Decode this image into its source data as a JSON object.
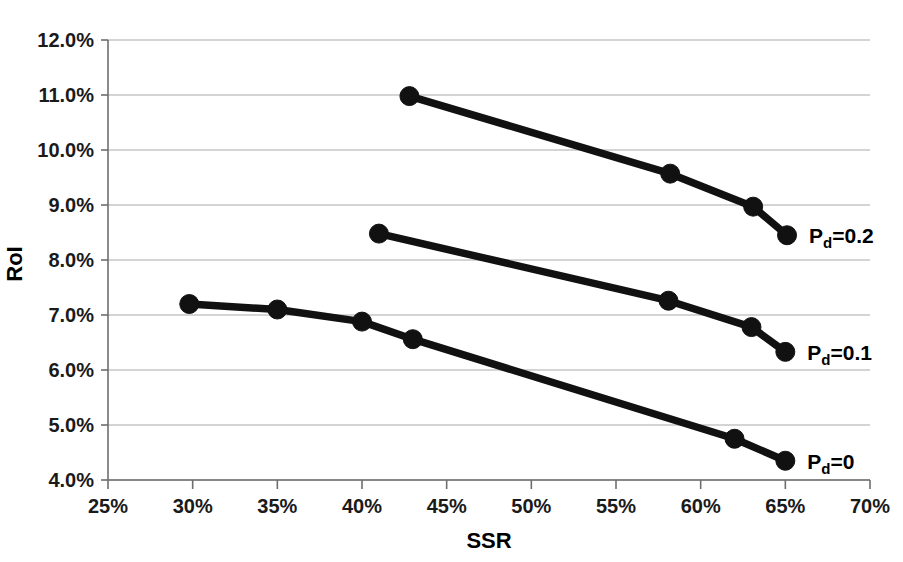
{
  "chart_data": {
    "type": "line",
    "title": "",
    "xlabel": "SSR",
    "ylabel": "RoI",
    "xlim": [
      25,
      70
    ],
    "ylim": [
      4.0,
      12.0
    ],
    "grid": "horizontal",
    "legend_position": "inline-right-of-last-point",
    "x_ticks": [
      "25%",
      "30%",
      "35%",
      "40%",
      "45%",
      "50%",
      "55%",
      "60%",
      "65%",
      "70%"
    ],
    "x_tick_values": [
      25,
      30,
      35,
      40,
      45,
      50,
      55,
      60,
      65,
      70
    ],
    "y_ticks": [
      "4.0%",
      "5.0%",
      "6.0%",
      "7.0%",
      "8.0%",
      "9.0%",
      "10.0%",
      "11.0%",
      "12.0%"
    ],
    "y_tick_values": [
      4.0,
      5.0,
      6.0,
      7.0,
      8.0,
      9.0,
      10.0,
      11.0,
      12.0
    ],
    "marker": "filled-circle",
    "series": [
      {
        "name": "P_d=0.2",
        "label_main": "P",
        "label_sub": "d",
        "label_rest": "=0.2",
        "color": "#111111",
        "points": [
          {
            "x": 42.8,
            "y": 10.98
          },
          {
            "x": 58.2,
            "y": 9.57
          },
          {
            "x": 63.1,
            "y": 8.97
          },
          {
            "x": 65.1,
            "y": 8.45
          }
        ]
      },
      {
        "name": "P_d=0.1",
        "label_main": "P",
        "label_sub": "d",
        "label_rest": "=0.1",
        "color": "#111111",
        "points": [
          {
            "x": 41.0,
            "y": 8.48
          },
          {
            "x": 58.1,
            "y": 7.26
          },
          {
            "x": 63.0,
            "y": 6.78
          },
          {
            "x": 65.0,
            "y": 6.33
          }
        ]
      },
      {
        "name": "P_d=0",
        "label_main": "P",
        "label_sub": "d",
        "label_rest": "=0",
        "color": "#111111",
        "points": [
          {
            "x": 29.8,
            "y": 7.2
          },
          {
            "x": 35.0,
            "y": 7.1
          },
          {
            "x": 40.0,
            "y": 6.88
          },
          {
            "x": 43.0,
            "y": 6.56
          },
          {
            "x": 62.0,
            "y": 4.75
          },
          {
            "x": 65.0,
            "y": 4.35
          }
        ]
      }
    ]
  },
  "figure": {
    "background_color": "#ffffff",
    "line_color": "#111111",
    "grid_color": "#a9a9a9",
    "axis_color": "#6e6e6e",
    "text_color": "#000000"
  }
}
